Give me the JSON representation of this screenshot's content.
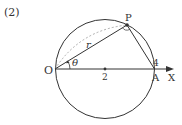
{
  "problem_label": "(2)",
  "points": {
    "origin": "O",
    "point_p": "P",
    "point_a": "A",
    "center_tick": "2",
    "a_tick": "4"
  },
  "axis_label": "X",
  "labels": {
    "radius": "r",
    "angle": "θ"
  },
  "colors": {
    "stroke": "#333333",
    "dashed": "#999999"
  }
}
